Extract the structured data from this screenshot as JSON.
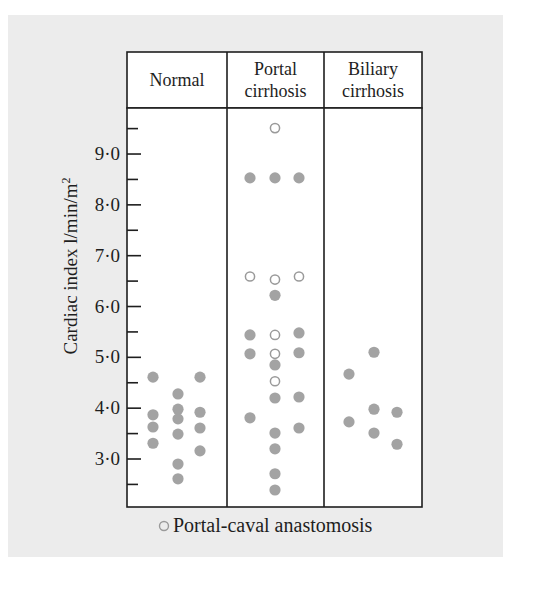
{
  "chart_data": {
    "type": "scatter",
    "title": "",
    "ylabel": "Cardiac index l/min/m",
    "ylabel_superscript": "2",
    "xlabel": "",
    "ylim": [
      2.06,
      9.9
    ],
    "yticks_major": [
      3.0,
      4.0,
      5.0,
      6.0,
      7.0,
      8.0,
      9.0
    ],
    "yticks_minor": [
      2.5,
      3.5,
      4.5,
      5.5,
      6.5,
      7.5,
      8.5,
      9.5
    ],
    "ytick_labels": [
      "3·0",
      "4·0",
      "5·0",
      "6·0",
      "7·0",
      "8·0",
      "9·0"
    ],
    "grid": false,
    "categories": [
      "Normal",
      "Portal cirrhosis",
      "Biliary cirrhosis"
    ],
    "category_header_lines": [
      [
        "Normal"
      ],
      [
        "Portal",
        "cirrhosis"
      ],
      [
        "Biliary",
        "cirrhosis"
      ]
    ],
    "legend": {
      "position": "bottom",
      "entries": [
        {
          "marker": "open-circle",
          "label": "Portal-caval anastomosis"
        }
      ]
    },
    "series": [
      {
        "name": "Normal",
        "points": [
          {
            "col": 0,
            "y": 4.61,
            "open": false
          },
          {
            "col": 0,
            "y": 3.87,
            "open": false
          },
          {
            "col": 0,
            "y": 3.63,
            "open": false
          },
          {
            "col": 0,
            "y": 3.31,
            "open": false
          },
          {
            "col": 1,
            "y": 4.28,
            "open": false
          },
          {
            "col": 1,
            "y": 3.98,
            "open": false
          },
          {
            "col": 1,
            "y": 3.79,
            "open": false
          },
          {
            "col": 1,
            "y": 3.49,
            "open": false
          },
          {
            "col": 1,
            "y": 2.9,
            "open": false
          },
          {
            "col": 1,
            "y": 2.61,
            "open": false
          },
          {
            "col": 2,
            "y": 4.61,
            "open": false
          },
          {
            "col": 2,
            "y": 3.92,
            "open": false
          },
          {
            "col": 2,
            "y": 3.61,
            "open": false
          },
          {
            "col": 2,
            "y": 3.16,
            "open": false
          }
        ]
      },
      {
        "name": "Portal cirrhosis",
        "points": [
          {
            "col": 1,
            "y": 9.51,
            "open": true
          },
          {
            "col": 0,
            "y": 8.53,
            "open": false
          },
          {
            "col": 1,
            "y": 8.53,
            "open": false
          },
          {
            "col": 2,
            "y": 8.53,
            "open": false
          },
          {
            "col": 0,
            "y": 6.59,
            "open": true
          },
          {
            "col": 1,
            "y": 6.53,
            "open": true
          },
          {
            "col": 2,
            "y": 6.59,
            "open": true
          },
          {
            "col": 1,
            "y": 6.22,
            "open": false
          },
          {
            "col": 0,
            "y": 5.44,
            "open": false
          },
          {
            "col": 1,
            "y": 5.44,
            "open": true
          },
          {
            "col": 2,
            "y": 5.48,
            "open": false
          },
          {
            "col": 0,
            "y": 5.07,
            "open": false
          },
          {
            "col": 1,
            "y": 5.07,
            "open": true
          },
          {
            "col": 2,
            "y": 5.09,
            "open": false
          },
          {
            "col": 1,
            "y": 4.85,
            "open": false
          },
          {
            "col": 1,
            "y": 4.53,
            "open": true
          },
          {
            "col": 1,
            "y": 4.2,
            "open": false
          },
          {
            "col": 2,
            "y": 4.22,
            "open": false
          },
          {
            "col": 0,
            "y": 3.81,
            "open": false
          },
          {
            "col": 2,
            "y": 3.61,
            "open": false
          },
          {
            "col": 1,
            "y": 3.51,
            "open": false
          },
          {
            "col": 1,
            "y": 3.2,
            "open": false
          },
          {
            "col": 1,
            "y": 2.71,
            "open": false
          },
          {
            "col": 1,
            "y": 2.39,
            "open": false
          }
        ]
      },
      {
        "name": "Biliary cirrhosis",
        "points": [
          {
            "col": 1,
            "y": 5.1,
            "open": false
          },
          {
            "col": 0,
            "y": 4.67,
            "open": false
          },
          {
            "col": 1,
            "y": 3.98,
            "open": false
          },
          {
            "col": 2,
            "y": 3.92,
            "open": false
          },
          {
            "col": 0,
            "y": 3.73,
            "open": false
          },
          {
            "col": 1,
            "y": 3.51,
            "open": false
          },
          {
            "col": 2,
            "y": 3.29,
            "open": false
          }
        ]
      }
    ]
  },
  "colors": {
    "panel_bg": "#ececec",
    "plot_bg": "#ffffff",
    "line": "#1e1e1e",
    "dot_fill": "#a3a3a3",
    "open_stroke": "#9a9a9a"
  },
  "legend_label": "Portal-caval anastomosis"
}
